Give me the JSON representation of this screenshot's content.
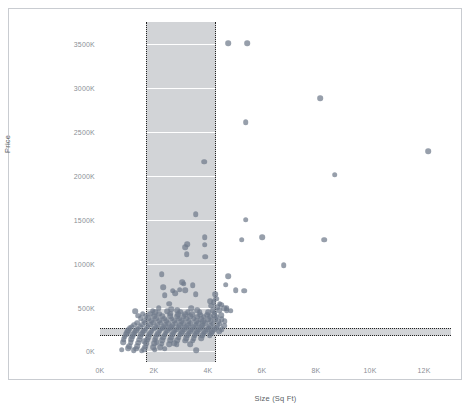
{
  "chart_data": {
    "type": "scatter",
    "title": "",
    "xlabel": "Size (Sq Ft)",
    "ylabel": "Price",
    "xlim": [
      0,
      13000
    ],
    "ylim": [
      -120000,
      3750000
    ],
    "x_tick_labels": [
      "0K",
      "2K",
      "4K",
      "6K",
      "8K",
      "10K",
      "12K"
    ],
    "x_tick_values": [
      0,
      2000,
      4000,
      6000,
      8000,
      10000,
      12000
    ],
    "y_tick_labels": [
      "0K",
      "500K",
      "1000K",
      "1500K",
      "2000K",
      "2500K",
      "3000K",
      "3500K"
    ],
    "y_tick_values": [
      0,
      500000,
      1000000,
      1500000,
      2000000,
      2500000,
      3000000,
      3500000
    ],
    "grid": "horizontal-white-inside-bands",
    "legend": "none",
    "point_color": "#6f7a8a",
    "point_opacity": 0.72,
    "point_size_px": 5.6,
    "highlight_bands": [
      {
        "orientation": "vertical",
        "axis": "x",
        "from": 1700,
        "to": 4300,
        "fill": "#d2d4d7",
        "border": "dotted",
        "border_color": "#222222"
      },
      {
        "orientation": "horizontal",
        "axis": "y",
        "from": 175000,
        "to": 272000,
        "fill": "#d2d4d7",
        "border": "dotted",
        "border_color": "#222222"
      }
    ],
    "points": [
      [
        4750,
        3510000
      ],
      [
        5450,
        3510000
      ],
      [
        8150,
        2880000
      ],
      [
        5400,
        2610000
      ],
      [
        12150,
        2280000
      ],
      [
        8700,
        2010000
      ],
      [
        3870,
        2160000
      ],
      [
        3550,
        1560000
      ],
      [
        5400,
        1500000
      ],
      [
        3880,
        1300000
      ],
      [
        6000,
        1300000
      ],
      [
        5250,
        1270000
      ],
      [
        8300,
        1270000
      ],
      [
        3880,
        1215000
      ],
      [
        3220,
        1220000
      ],
      [
        3160,
        1190000
      ],
      [
        3210,
        1110000
      ],
      [
        3890,
        1080000
      ],
      [
        6800,
        985000
      ],
      [
        4750,
        855000
      ],
      [
        2280,
        880000
      ],
      [
        3050,
        790000
      ],
      [
        3100,
        770000
      ],
      [
        4660,
        760000
      ],
      [
        3440,
        755000
      ],
      [
        2330,
        730000
      ],
      [
        2950,
        705000
      ],
      [
        5020,
        695000
      ],
      [
        5350,
        690000
      ],
      [
        2700,
        690000
      ],
      [
        3160,
        700000
      ],
      [
        2780,
        665000
      ],
      [
        3540,
        650000
      ],
      [
        4260,
        650000
      ],
      [
        2400,
        640000
      ],
      [
        4300,
        600000
      ],
      [
        4080,
        575000
      ],
      [
        4210,
        560000
      ],
      [
        4430,
        545000
      ],
      [
        2560,
        545000
      ],
      [
        4480,
        530000
      ],
      [
        4120,
        520000
      ],
      [
        4350,
        505000
      ],
      [
        2180,
        495000
      ],
      [
        4600,
        492000
      ],
      [
        4700,
        490000
      ],
      [
        2640,
        480000
      ],
      [
        3380,
        490000
      ],
      [
        1300,
        455000
      ],
      [
        1950,
        465000
      ],
      [
        2860,
        470000
      ],
      [
        3600,
        470000
      ],
      [
        4180,
        470000
      ],
      [
        4410,
        468000
      ],
      [
        2050,
        450000
      ],
      [
        2480,
        455000
      ],
      [
        2980,
        452000
      ],
      [
        3250,
        448000
      ],
      [
        3700,
        446000
      ],
      [
        4000,
        444000
      ],
      [
        4250,
        440000
      ],
      [
        1580,
        430000
      ],
      [
        1850,
        430000
      ],
      [
        2200,
        432000
      ],
      [
        2600,
        428000
      ],
      [
        2900,
        426000
      ],
      [
        3150,
        424000
      ],
      [
        3420,
        422000
      ],
      [
        3720,
        420000
      ],
      [
        3980,
        418000
      ],
      [
        4220,
        416000
      ],
      [
        4480,
        414000
      ],
      [
        1420,
        405000
      ],
      [
        1700,
        404000
      ],
      [
        2010,
        403000
      ],
      [
        2300,
        402000
      ],
      [
        2590,
        401000
      ],
      [
        2870,
        400000
      ],
      [
        3100,
        399000
      ],
      [
        3340,
        398000
      ],
      [
        3600,
        397000
      ],
      [
        3840,
        396000
      ],
      [
        4080,
        395000
      ],
      [
        4320,
        394000
      ],
      [
        1500,
        378000
      ],
      [
        1780,
        377000
      ],
      [
        2080,
        376000
      ],
      [
        2370,
        375000
      ],
      [
        2650,
        374000
      ],
      [
        2930,
        373000
      ],
      [
        3200,
        372000
      ],
      [
        3470,
        371000
      ],
      [
        3740,
        370000
      ],
      [
        4010,
        369000
      ],
      [
        4260,
        368000
      ],
      [
        4500,
        367000
      ],
      [
        1620,
        352000
      ],
      [
        1900,
        351000
      ],
      [
        2190,
        350000
      ],
      [
        2460,
        349000
      ],
      [
        2740,
        348000
      ],
      [
        3010,
        347000
      ],
      [
        3290,
        346000
      ],
      [
        3560,
        345000
      ],
      [
        3830,
        344000
      ],
      [
        4100,
        343000
      ],
      [
        4370,
        342000
      ],
      [
        4620,
        341000
      ],
      [
        1380,
        328000
      ],
      [
        1680,
        327000
      ],
      [
        1960,
        326000
      ],
      [
        2250,
        325000
      ],
      [
        2530,
        324000
      ],
      [
        2810,
        323000
      ],
      [
        3080,
        322000
      ],
      [
        3360,
        321000
      ],
      [
        3640,
        320000
      ],
      [
        3900,
        319000
      ],
      [
        4170,
        318000
      ],
      [
        4440,
        317000
      ],
      [
        1260,
        305000
      ],
      [
        1560,
        304000
      ],
      [
        1850,
        303000
      ],
      [
        2130,
        302000
      ],
      [
        2420,
        301000
      ],
      [
        2700,
        300000
      ],
      [
        2980,
        299000
      ],
      [
        3260,
        298000
      ],
      [
        3540,
        297000
      ],
      [
        3810,
        296000
      ],
      [
        4090,
        295000
      ],
      [
        4360,
        294000
      ],
      [
        4610,
        293000
      ],
      [
        1180,
        282000
      ],
      [
        1480,
        281000
      ],
      [
        1770,
        280000
      ],
      [
        2060,
        279000
      ],
      [
        2350,
        278000
      ],
      [
        2630,
        277000
      ],
      [
        2910,
        276000
      ],
      [
        3190,
        275000
      ],
      [
        3470,
        274000
      ],
      [
        3750,
        273000
      ],
      [
        4020,
        272000
      ],
      [
        4300,
        271000
      ],
      [
        1100,
        262000
      ],
      [
        1400,
        261000
      ],
      [
        1700,
        260000
      ],
      [
        1990,
        259000
      ],
      [
        2280,
        258000
      ],
      [
        2560,
        257000
      ],
      [
        2840,
        256000
      ],
      [
        3120,
        255000
      ],
      [
        3400,
        254000
      ],
      [
        3680,
        253000
      ],
      [
        3960,
        252000
      ],
      [
        4230,
        251000
      ],
      [
        4500,
        250000
      ],
      [
        1050,
        240000
      ],
      [
        1340,
        239000
      ],
      [
        1630,
        238000
      ],
      [
        1920,
        237000
      ],
      [
        2210,
        236000
      ],
      [
        2490,
        235000
      ],
      [
        2770,
        234000
      ],
      [
        3050,
        233000
      ],
      [
        3330,
        232000
      ],
      [
        3610,
        231000
      ],
      [
        3890,
        230000
      ],
      [
        4160,
        229000
      ],
      [
        4420,
        228000
      ],
      [
        1000,
        218000
      ],
      [
        1290,
        217000
      ],
      [
        1580,
        216000
      ],
      [
        1870,
        215000
      ],
      [
        2160,
        214000
      ],
      [
        2440,
        213000
      ],
      [
        2720,
        212000
      ],
      [
        3000,
        211000
      ],
      [
        3280,
        210000
      ],
      [
        3560,
        209000
      ],
      [
        3840,
        208000
      ],
      [
        4110,
        207000
      ],
      [
        960,
        196000
      ],
      [
        1240,
        195000
      ],
      [
        1530,
        194000
      ],
      [
        1820,
        193000
      ],
      [
        2110,
        192000
      ],
      [
        2390,
        191000
      ],
      [
        2670,
        190000
      ],
      [
        2950,
        189000
      ],
      [
        3230,
        188000
      ],
      [
        3510,
        187000
      ],
      [
        3790,
        186000
      ],
      [
        4060,
        185000
      ],
      [
        920,
        170000
      ],
      [
        1200,
        168000
      ],
      [
        1490,
        166000
      ],
      [
        1780,
        164000
      ],
      [
        2070,
        162000
      ],
      [
        2350,
        160000
      ],
      [
        2630,
        158000
      ],
      [
        2910,
        156000
      ],
      [
        3190,
        154000
      ],
      [
        3470,
        152000
      ],
      [
        3750,
        150000
      ],
      [
        880,
        140000
      ],
      [
        1160,
        138000
      ],
      [
        1450,
        136000
      ],
      [
        1740,
        134000
      ],
      [
        2030,
        132000
      ],
      [
        2310,
        130000
      ],
      [
        2590,
        128000
      ],
      [
        2870,
        126000
      ],
      [
        3150,
        124000
      ],
      [
        3430,
        122000
      ],
      [
        850,
        108000
      ],
      [
        1130,
        104000
      ],
      [
        1420,
        100000
      ],
      [
        1710,
        96000
      ],
      [
        2000,
        92000
      ],
      [
        2280,
        88000
      ],
      [
        2560,
        84000
      ],
      [
        2840,
        80000
      ],
      [
        1090,
        62000
      ],
      [
        1380,
        58000
      ],
      [
        1670,
        54000
      ],
      [
        1960,
        50000
      ],
      [
        2240,
        46000
      ],
      [
        1050,
        34000
      ],
      [
        1340,
        30000
      ],
      [
        1630,
        26000
      ],
      [
        800,
        20000
      ],
      [
        1250,
        14000
      ],
      [
        1550,
        10000
      ],
      [
        3570,
        12000
      ],
      [
        2390,
        30000
      ],
      [
        2020,
        22000
      ],
      [
        4700,
        470000
      ],
      [
        4840,
        465000
      ],
      [
        1630,
        120000
      ],
      [
        2100,
        105000
      ],
      [
        2750,
        95000
      ],
      [
        3350,
        85000
      ]
    ]
  },
  "axis": {
    "y_title": "Price",
    "x_title": "Size (Sq Ft)"
  }
}
